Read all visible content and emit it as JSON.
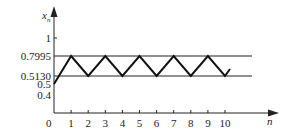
{
  "chart_data": {
    "type": "line",
    "title": "",
    "xlabel": "n",
    "ylabel": "x_n",
    "x": [
      0,
      1,
      2,
      3,
      4,
      5,
      6,
      7,
      8,
      9,
      10
    ],
    "series": [
      {
        "name": "x_n",
        "values": [
          0.5,
          0.7995,
          0.513,
          0.7995,
          0.513,
          0.7995,
          0.513,
          0.7995,
          0.513,
          0.7995,
          0.513
        ]
      }
    ],
    "x_ticks": [
      "0",
      "1",
      "2",
      "3",
      "4",
      "5",
      "6",
      "7",
      "8",
      "9",
      "10"
    ],
    "y_ticks": [
      "1",
      "0.7995",
      "0.5130",
      "0.5",
      "0.4"
    ],
    "reference_lines": [
      0.7995,
      0.513
    ],
    "grid": false,
    "legend": "none"
  },
  "labels": {
    "y_axis": "x",
    "y_axis_sub": "n",
    "x_axis": "n",
    "origin": "0"
  }
}
